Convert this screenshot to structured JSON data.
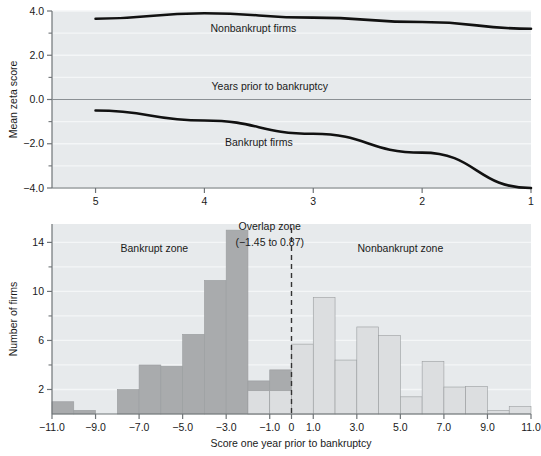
{
  "chart_data": [
    {
      "id": "mean-zeta-score-over-time",
      "type": "line",
      "title": "",
      "xlabel": "",
      "ylabel": "Mean zeta score",
      "x": [
        5,
        4,
        3,
        2,
        1
      ],
      "xtick_labels": [
        "5",
        "4",
        "3",
        "2",
        "1"
      ],
      "ytick_labels": [
        "4.0",
        "2.0",
        "0.0",
        "-2.0",
        "-4.0"
      ],
      "ytick_values": [
        4.0,
        2.0,
        0.0,
        -2.0,
        -4.0
      ],
      "yminor_values": [
        3.0,
        1.0,
        -1.0,
        -3.0
      ],
      "xlim": [
        5.4,
        1.0
      ],
      "ylim": [
        -4.0,
        4.0
      ],
      "grid": true,
      "legend_position": "inline-annotation",
      "series": [
        {
          "name": "Nonbankrupt firms",
          "values": [
            3.65,
            3.9,
            3.7,
            3.5,
            3.2
          ],
          "color": "#111111"
        },
        {
          "name": "Bankrupt firms",
          "values": [
            -0.5,
            -0.95,
            -1.55,
            -2.4,
            -4.0
          ],
          "color": "#111111"
        }
      ],
      "annotations": [
        {
          "text": "Nonbankrupt firms",
          "x": 3.55,
          "y": 3.05
        },
        {
          "text": "Years prior to bankruptcy",
          "x": 3.4,
          "y": 0.45
        },
        {
          "text": "Bankrupt firms",
          "x": 3.5,
          "y": -2.1
        }
      ]
    },
    {
      "id": "score-one-year-prior-histogram",
      "type": "bar",
      "title": "",
      "xlabel": "Score one year prior to bankruptcy",
      "ylabel": "Number of firms",
      "xtick_labels": [
        "-11.0",
        "-9.0",
        "-7.0",
        "-5.0",
        "-3.0",
        "-1.0",
        "0",
        "1.0",
        "3.0",
        "5.0",
        "7.0",
        "9.0",
        "11.0"
      ],
      "xtick_values": [
        -11,
        -9,
        -7,
        -5,
        -3,
        -1,
        0,
        1,
        3,
        5,
        7,
        9,
        11
      ],
      "ytick_labels": [
        "2",
        "6",
        "10",
        "14"
      ],
      "ytick_values": [
        2,
        6,
        10,
        14
      ],
      "yminor_values": [
        4,
        8,
        12
      ],
      "xlim": [
        -11,
        11
      ],
      "ylim": [
        0,
        15.5
      ],
      "grid": true,
      "bin_width": 1.0,
      "bin_starts": [
        -11,
        -10,
        -9,
        -8,
        -7,
        -6,
        -5,
        -4,
        -3,
        -2,
        -1,
        0,
        1,
        2,
        3,
        4,
        5,
        6,
        7,
        8,
        9,
        10
      ],
      "series": [
        {
          "name": "Bankrupt firms",
          "color": "#a9abad",
          "values": [
            1,
            0.3,
            0,
            2,
            4,
            3.9,
            6.5,
            10.9,
            15,
            2.7,
            3.6,
            2,
            0,
            0,
            0,
            0,
            0,
            0,
            0,
            0,
            0,
            0
          ]
        },
        {
          "name": "Nonbankrupt firms",
          "color": "#dcdee0",
          "values": [
            0,
            0,
            0,
            0,
            0,
            0,
            0,
            0,
            0,
            1.9,
            1.9,
            5.7,
            9.5,
            4.4,
            7.1,
            6.4,
            1.4,
            4.3,
            2.2,
            2.25,
            0.3,
            0.6
          ]
        }
      ],
      "annotations": [
        {
          "text": "Bankrupt zone",
          "x": -6.3,
          "y": 13.2
        },
        {
          "text": "Overlap zone",
          "x": -1.0,
          "y": 15.0
        },
        {
          "text": "(−1.45 to 0.87)",
          "x": -1.0,
          "y": 13.7
        },
        {
          "text": "Nonbankrupt zone",
          "x": 5.0,
          "y": 13.2
        }
      ],
      "divider": {
        "name": "overlap-zone-divider",
        "x": 0,
        "style": "dashed",
        "color": "#333333"
      }
    }
  ],
  "figure": {
    "background": "#ffffff",
    "panel_background": "#e7eaec",
    "gridline_color": "#f4f6f7",
    "axis_color": "#6f7477",
    "text_color": "#1a1a1a"
  }
}
